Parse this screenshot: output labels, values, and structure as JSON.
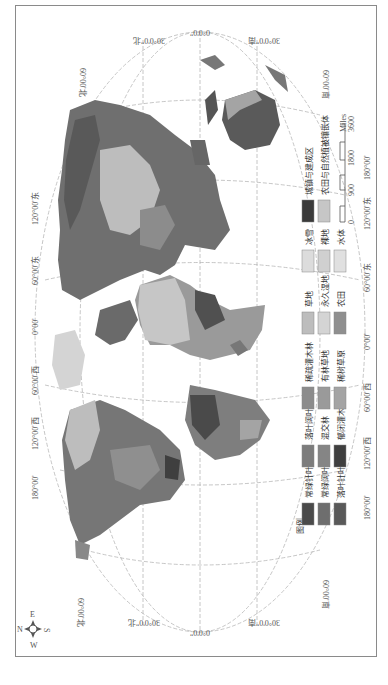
{
  "map": {
    "graticule_labels_lon": [
      "180°00'",
      "120°00'西",
      "60°00'西",
      "0°00'",
      "60°00'东",
      "120°00'东",
      "180°00'"
    ],
    "graticule_labels_lat_top": [
      "30°0'0\"北",
      "0°0'0\"",
      "30°0'0\"南"
    ],
    "graticule_labels_lat_bottom": [
      "30°0'0\"北",
      "0°0'0\"",
      "30°0'0\"南"
    ],
    "lat60_labels": [
      "60°00'北",
      "60°00'南",
      "60°00'北",
      "60°00'南"
    ]
  },
  "legend": {
    "title": "图例",
    "items": [
      {
        "label": "常绿针叶林",
        "color": "#4a4a4a"
      },
      {
        "label": "常绿阔叶林",
        "color": "#6e6e6e"
      },
      {
        "label": "落叶针叶林",
        "color": "#595959"
      },
      {
        "label": "落叶阔叶林",
        "color": "#7c7c7c"
      },
      {
        "label": "混交林",
        "color": "#858585"
      },
      {
        "label": "郁闭灌木林",
        "color": "#3f3f3f"
      },
      {
        "label": "稀疏灌木林",
        "color": "#8c8c8c"
      },
      {
        "label": "有林草地",
        "color": "#9a9a9a"
      },
      {
        "label": "稀树草原",
        "color": "#a4a4a4"
      },
      {
        "label": "草地",
        "color": "#bdbdbd"
      },
      {
        "label": "永久湿地",
        "color": "#d4d4d4"
      },
      {
        "label": "农田",
        "color": "#8f8f8f"
      },
      {
        "label": "冰雪",
        "color": "#dcdcdc"
      },
      {
        "label": "裸地",
        "color": "#d0d0d0"
      },
      {
        "label": "水体",
        "color": "#e0e0e0"
      },
      {
        "label": "城镇与建成区",
        "color": "#3a3a3a"
      },
      {
        "label": "农田与自然植被镶嵌体",
        "color": "#c6c6c6"
      }
    ]
  },
  "scale_bar": {
    "ticks": [
      "0",
      "900",
      "1800",
      "3600"
    ],
    "unit": "Miles"
  },
  "compass": {
    "n": "N",
    "s": "S",
    "e": "E",
    "w": "W"
  }
}
